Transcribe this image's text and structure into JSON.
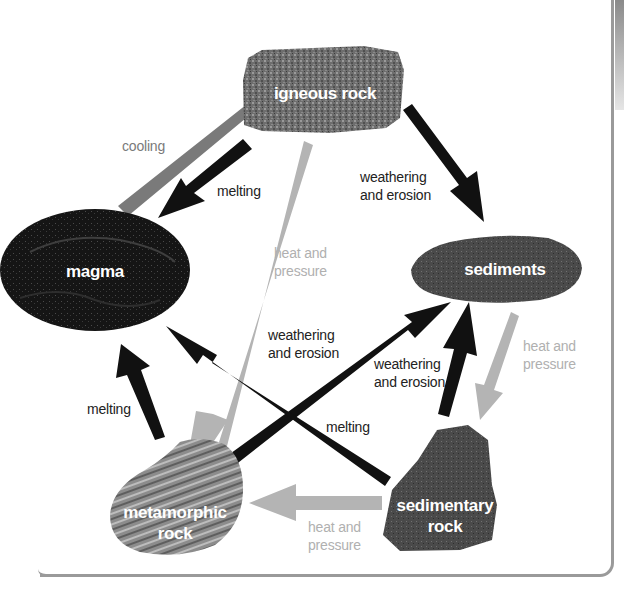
{
  "diagram": {
    "colors": {
      "process_melting": "#111111",
      "process_weathering": "#111111",
      "process_cooling": "#7a7a7a",
      "process_heat_pressure": "#b4b4b4",
      "frame_border": "#9a9a9a"
    },
    "nodes": {
      "igneous": "igneous rock",
      "magma": "magma",
      "sediments": "sediments",
      "sedimentary_line1": "sedimentary",
      "sedimentary_line2": "rock",
      "metamorphic_line1": "metamorphic",
      "metamorphic_line2": "rock"
    },
    "edges": [
      {
        "from": "magma",
        "to": "igneous rock",
        "label": "cooling"
      },
      {
        "from": "igneous rock",
        "to": "magma",
        "label": "melting"
      },
      {
        "from": "igneous rock",
        "to": "sediments",
        "label": "weathering and erosion"
      },
      {
        "from": "igneous rock",
        "to": "metamorphic rock",
        "label": "heat and pressure"
      },
      {
        "from": "metamorphic rock",
        "to": "magma",
        "label": "melting"
      },
      {
        "from": "metamorphic rock",
        "to": "sediments",
        "label": "weathering and erosion"
      },
      {
        "from": "sedimentary rock",
        "to": "magma",
        "label": "melting"
      },
      {
        "from": "sedimentary rock",
        "to": "sediments",
        "label": "weathering and erosion"
      },
      {
        "from": "sediments",
        "to": "sedimentary rock",
        "label": "heat and pressure"
      },
      {
        "from": "sedimentary rock",
        "to": "metamorphic rock",
        "label": "heat and pressure"
      }
    ],
    "labels": {
      "cooling": "cooling",
      "melting_top": "melting",
      "weathering_top_1": "weathering",
      "weathering_top_2": "and erosion",
      "heat_left_1": "heat and",
      "heat_left_2": "pressure",
      "weathering_mid_1": "weathering",
      "weathering_mid_2": "and erosion",
      "weathering_right_1": "weathering",
      "weathering_right_2": "and erosion",
      "heat_right_1": "heat and",
      "heat_right_2": "pressure",
      "melting_left": "melting",
      "melting_cross": "melting",
      "heat_bottom_1": "heat and",
      "heat_bottom_2": "pressure"
    }
  }
}
